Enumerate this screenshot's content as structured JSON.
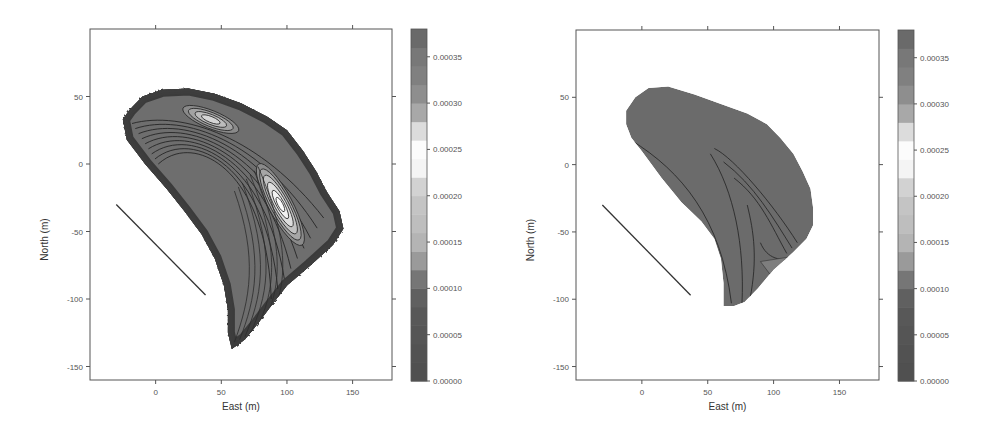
{
  "chart_data": [
    {
      "type": "heatmap",
      "subtype": "filled-contour",
      "title": "",
      "xlabel": "East (m)",
      "ylabel": "North (m)",
      "xlim": [
        -50,
        180
      ],
      "ylim": [
        -160,
        100
      ],
      "xticks": [
        0,
        50,
        100,
        150
      ],
      "yticks": [
        50,
        0,
        -50,
        -100,
        -150
      ],
      "grid": false,
      "line_segment": {
        "from": [
          -30,
          -30
        ],
        "to": [
          38,
          -97
        ]
      },
      "region_outline": [
        [
          -25,
          33
        ],
        [
          -20,
          40
        ],
        [
          -10,
          50
        ],
        [
          5,
          55
        ],
        [
          25,
          56
        ],
        [
          45,
          52
        ],
        [
          65,
          45
        ],
        [
          85,
          35
        ],
        [
          100,
          25
        ],
        [
          112,
          10
        ],
        [
          122,
          -5
        ],
        [
          130,
          -20
        ],
        [
          140,
          -35
        ],
        [
          143,
          -48
        ],
        [
          135,
          -60
        ],
        [
          118,
          -75
        ],
        [
          100,
          -90
        ],
        [
          88,
          -105
        ],
        [
          78,
          -118
        ],
        [
          68,
          -130
        ],
        [
          58,
          -137
        ],
        [
          55,
          -125
        ],
        [
          55,
          -108
        ],
        [
          52,
          -90
        ],
        [
          45,
          -70
        ],
        [
          35,
          -52
        ],
        [
          22,
          -35
        ],
        [
          8,
          -18
        ],
        [
          -8,
          0
        ],
        [
          -22,
          18
        ]
      ],
      "hotspots": [
        {
          "name": "upper-lobe",
          "center": [
            42,
            33
          ],
          "peak": 0.00022
        },
        {
          "name": "central-ridge",
          "center": [
            95,
            -30
          ],
          "peak": 0.00025
        }
      ],
      "colorbar": {
        "min": 0.0,
        "max": 0.00038,
        "ticks": [
          "0.00000",
          "0.00005",
          "0.00010",
          "0.00015",
          "0.00020",
          "0.00025",
          "0.00030",
          "0.00035"
        ],
        "levels": [
          0,
          2e-05,
          4e-05,
          6e-05,
          8e-05,
          0.0001,
          0.00012,
          0.00014,
          0.00016,
          0.00018,
          0.0002,
          0.00022,
          0.00024,
          0.00026,
          0.00028,
          0.0003,
          0.00032,
          0.00034,
          0.00036,
          0.00038
        ],
        "colors": [
          "#505050",
          "#525252",
          "#555555",
          "#585858",
          "#606060",
          "#767676",
          "#9a9a9a",
          "#b4b4b4",
          "#bebebe",
          "#c4c4c4",
          "#d2d2d2",
          "#f4f4f4",
          "#fcfcfc",
          "#dcdcdc",
          "#a8a8a8",
          "#8e8e8e",
          "#808080",
          "#787878",
          "#6a6a6a"
        ]
      }
    },
    {
      "type": "heatmap",
      "subtype": "filled-contour",
      "title": "",
      "xlabel": "East (m)",
      "ylabel": "North (m)",
      "xlim": [
        -50,
        180
      ],
      "ylim": [
        -160,
        100
      ],
      "xticks": [
        0,
        50,
        100,
        150
      ],
      "yticks": [
        50,
        0,
        -50,
        -100,
        -150
      ],
      "grid": false,
      "line_segment": {
        "from": [
          -30,
          -30
        ],
        "to": [
          37,
          -97
        ]
      },
      "region_outline": [
        [
          -12,
          30
        ],
        [
          -12,
          40
        ],
        [
          -5,
          50
        ],
        [
          5,
          57
        ],
        [
          20,
          58
        ],
        [
          40,
          52
        ],
        [
          60,
          45
        ],
        [
          80,
          38
        ],
        [
          95,
          30
        ],
        [
          105,
          20
        ],
        [
          115,
          8
        ],
        [
          122,
          -5
        ],
        [
          128,
          -18
        ],
        [
          130,
          -32
        ],
        [
          130,
          -45
        ],
        [
          125,
          -55
        ],
        [
          115,
          -65
        ],
        [
          100,
          -78
        ],
        [
          88,
          -92
        ],
        [
          78,
          -102
        ],
        [
          70,
          -105
        ],
        [
          62,
          -105
        ],
        [
          62,
          -88
        ],
        [
          60,
          -70
        ],
        [
          55,
          -55
        ],
        [
          45,
          -42
        ],
        [
          30,
          -28
        ],
        [
          15,
          -10
        ],
        [
          0,
          10
        ],
        [
          -8,
          20
        ]
      ],
      "colorbar": {
        "min": 0.0,
        "max": 0.00038,
        "ticks": [
          "0.00000",
          "0.00005",
          "0.00010",
          "0.00015",
          "0.00020",
          "0.00025",
          "0.00030",
          "0.00035"
        ],
        "levels": [
          0,
          2e-05,
          4e-05,
          6e-05,
          8e-05,
          0.0001,
          0.00012,
          0.00014,
          0.00016,
          0.00018,
          0.0002,
          0.00022,
          0.00024,
          0.00026,
          0.00028,
          0.0003,
          0.00032,
          0.00034,
          0.00036,
          0.00038
        ],
        "colors": [
          "#505050",
          "#525252",
          "#555555",
          "#585858",
          "#606060",
          "#767676",
          "#9a9a9a",
          "#b4b4b4",
          "#bebebe",
          "#c4c4c4",
          "#d2d2d2",
          "#f4f4f4",
          "#fcfcfc",
          "#dcdcdc",
          "#a8a8a8",
          "#8e8e8e",
          "#808080",
          "#787878",
          "#6a6a6a"
        ]
      }
    }
  ]
}
